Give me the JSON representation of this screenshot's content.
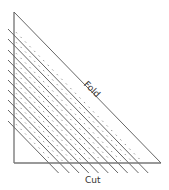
{
  "diagram": {
    "type": "folding-cutting-diagram",
    "labels": {
      "fold": "Fold",
      "cut": "Cut"
    },
    "colors": {
      "outline": "#666666",
      "solid_line": "#555555",
      "dashed_line": "#777777",
      "background": "#ffffff",
      "text": "#333333"
    },
    "triangle": {
      "apex": [
        14,
        12
      ],
      "bottom_left": [
        14,
        163
      ],
      "bottom_right": [
        161,
        163
      ]
    },
    "solid_cut_lines_count": 10,
    "dashed_lines_count": 10
  }
}
